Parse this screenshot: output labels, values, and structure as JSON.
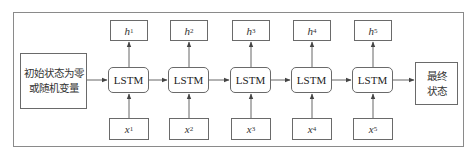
{
  "diagram": {
    "title": "",
    "initial_state": {
      "lines": [
        "初始状态为零",
        "或随机变量"
      ]
    },
    "final_state": {
      "lines": [
        "最终",
        "状态"
      ]
    },
    "cells": [
      {
        "label": "LSTM",
        "output_var": "h",
        "output_sub": "1",
        "input_var": "x",
        "input_sub": "1"
      },
      {
        "label": "LSTM",
        "output_var": "h",
        "output_sub": "2",
        "input_var": "x",
        "input_sub": "2"
      },
      {
        "label": "LSTM",
        "output_var": "h",
        "output_sub": "3",
        "input_var": "x",
        "input_sub": "3"
      },
      {
        "label": "LSTM",
        "output_var": "h",
        "output_sub": "4",
        "input_var": "x",
        "input_sub": "4"
      },
      {
        "label": "LSTM",
        "output_var": "h",
        "output_sub": "5",
        "input_var": "x",
        "input_sub": "5"
      }
    ],
    "colors": {
      "frame": "#8a8a8a",
      "box_border": "#6a6a6a",
      "arrow": "#555555",
      "text": "#333333"
    }
  }
}
